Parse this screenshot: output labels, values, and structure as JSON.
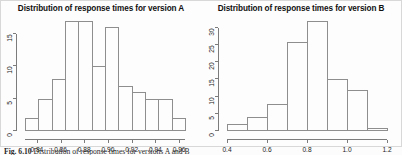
{
  "figure": {
    "caption_label": "Fig. 6.10",
    "caption_text": "Distribution of response times for versions A and B"
  },
  "chart_data": [
    {
      "type": "bar",
      "title": "Distribution of response times for version A",
      "xlabel": "",
      "ylabel": "",
      "grid": false,
      "legend": "none",
      "xlim": [
        0.83,
        0.965
      ],
      "ylim": [
        0,
        17
      ],
      "xticks": [
        "0.84",
        "0.86",
        "0.88",
        "0.90",
        "0.92",
        "0.94",
        "0.96"
      ],
      "xtick_values": [
        0.84,
        0.86,
        0.88,
        0.9,
        0.92,
        0.94,
        0.96
      ],
      "yticks": [
        "0",
        "5",
        "10",
        "15"
      ],
      "ytick_values": [
        0,
        5,
        10,
        15
      ],
      "bin_edges": [
        0.835,
        0.845,
        0.855,
        0.865,
        0.875,
        0.885,
        0.895,
        0.905,
        0.915,
        0.925,
        0.935,
        0.945,
        0.955
      ],
      "categories": [
        "0.835-0.845",
        "0.845-0.855",
        "0.855-0.865",
        "0.865-0.875",
        "0.875-0.885",
        "0.885-0.895",
        "0.895-0.905",
        "0.905-0.915",
        "0.915-0.925",
        "0.925-0.935",
        "0.935-0.945",
        "0.945-0.955"
      ],
      "values": [
        2,
        5,
        8,
        17,
        17,
        10,
        16,
        7,
        6,
        5,
        5,
        2
      ]
    },
    {
      "type": "bar",
      "title": "Distribution of response times for version B",
      "xlabel": "",
      "ylabel": "",
      "grid": false,
      "legend": "none",
      "xlim": [
        0.4,
        1.2
      ],
      "ylim": [
        0,
        32
      ],
      "xticks": [
        "0.4",
        "0.6",
        "0.8",
        "1.0",
        "1.2"
      ],
      "xtick_values": [
        0.4,
        0.6,
        0.8,
        1.0,
        1.2
      ],
      "yticks": [
        "0",
        "5",
        "10",
        "15",
        "20",
        "25",
        "30"
      ],
      "ytick_values": [
        0,
        5,
        10,
        15,
        20,
        25,
        30
      ],
      "bin_edges": [
        0.4,
        0.5,
        0.6,
        0.7,
        0.8,
        0.9,
        1.0,
        1.1,
        1.2
      ],
      "categories": [
        "0.4-0.5",
        "0.5-0.6",
        "0.6-0.7",
        "0.7-0.8",
        "0.8-0.9",
        "0.9-1.0",
        "1.0-1.1",
        "1.1-1.2"
      ],
      "values": [
        2,
        4,
        8,
        26,
        32,
        15,
        12,
        1
      ]
    }
  ]
}
